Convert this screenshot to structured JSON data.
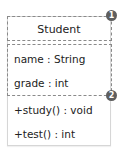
{
  "diagram": {
    "type": "uml-class",
    "class_name": "Student",
    "attributes": [
      "name : String",
      "grade : int"
    ],
    "methods": [
      "+study() : void",
      "+test() : int"
    ],
    "callouts": [
      {
        "number": "1",
        "target": "class-name-section"
      },
      {
        "number": "2",
        "target": "attributes-section"
      }
    ],
    "colors": {
      "badge": "#5e5e5e",
      "dashed_border": "#8a8a8a",
      "box_border": "#d6d6d6"
    }
  }
}
